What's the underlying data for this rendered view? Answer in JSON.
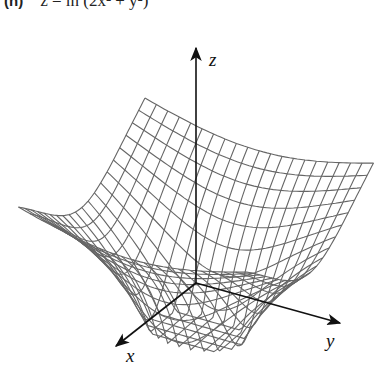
{
  "figure": {
    "label": "(n)",
    "equation": "z = ln (2x² + y²)"
  },
  "chart_data": {
    "type": "surface",
    "function": "ln(2*x^2 + y^2)",
    "x_range": [
      -1,
      1
    ],
    "y_range": [
      -1,
      1
    ],
    "grid_lines": 21,
    "z_clip_min": -1.84,
    "axes": {
      "x": "x",
      "y": "y",
      "z": "z"
    },
    "mesh_color": "#666666",
    "axis_color": "#111111"
  }
}
